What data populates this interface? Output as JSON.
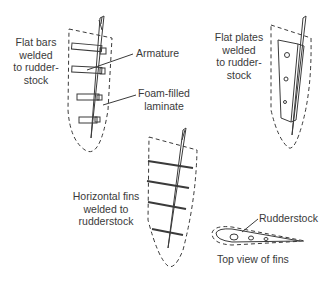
{
  "figure": {
    "type": "rudder construction diagram",
    "panels": [
      {
        "id": "flat-bars",
        "label_lines": [
          "Flat bars",
          "welded",
          "to rudder-",
          "stock"
        ],
        "callouts": [
          "Armature",
          "Foam-filled",
          "laminate"
        ]
      },
      {
        "id": "flat-plates",
        "label_lines": [
          "Flat plates",
          "welded",
          "to rudder-",
          "stock"
        ]
      },
      {
        "id": "horizontal-fins",
        "label_lines": [
          "Horizontal fins",
          "welded to",
          "rudderstock"
        ]
      },
      {
        "id": "top-view",
        "callout": "Rudderstock",
        "caption": "Top view of fins"
      }
    ]
  },
  "labels": {
    "flat_bars_1": "Flat bars",
    "flat_bars_2": "welded",
    "flat_bars_3": "to rudder-",
    "flat_bars_4": "stock",
    "armature": "Armature",
    "foam_1": "Foam-filled",
    "foam_2": "laminate",
    "flat_plates_1": "Flat plates",
    "flat_plates_2": "welded",
    "flat_plates_3": "to rudder-",
    "flat_plates_4": "stock",
    "fins_1": "Horizontal fins",
    "fins_2": "welded to",
    "fins_3": "rudderstock",
    "rudderstock": "Rudderstock",
    "top_view": "Top view of fins"
  },
  "colors": {
    "ink": "#3a3a3a",
    "background": "#ffffff"
  }
}
